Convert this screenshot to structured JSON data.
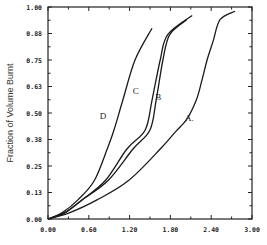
{
  "chart_data": {
    "type": "line",
    "title": "",
    "xlabel": "",
    "ylabel": "Fraction of Volume Burnt",
    "xlim": [
      0.0,
      3.0
    ],
    "ylim": [
      0.0,
      1.0
    ],
    "x_ticks": [
      "0.00",
      "0.60",
      "1.20",
      "1.80",
      "2.40",
      "3.00"
    ],
    "y_ticks": [
      "0.00",
      "0.13",
      "0.25",
      "0.38",
      "0.50",
      "0.63",
      "0.75",
      "0.88",
      "1.00"
    ],
    "grid": false,
    "legend": "inline curve labels",
    "series": [
      {
        "name": "A",
        "label": "A.",
        "x": [
          0.0,
          0.32,
          0.72,
          1.18,
          1.65,
          1.87,
          2.04,
          2.18,
          2.26,
          2.34,
          2.43,
          2.53,
          2.75
        ],
        "y": [
          0.0,
          0.03,
          0.09,
          0.18,
          0.33,
          0.41,
          0.47,
          0.56,
          0.65,
          0.75,
          0.84,
          0.94,
          0.98
        ]
      },
      {
        "name": "B",
        "label": "B",
        "x": [
          0.0,
          0.25,
          0.5,
          0.88,
          1.25,
          1.5,
          1.59,
          1.69,
          1.79,
          2.04
        ],
        "y": [
          0.0,
          0.03,
          0.09,
          0.18,
          0.33,
          0.42,
          0.56,
          0.75,
          0.87,
          0.94
        ]
      },
      {
        "name": "C",
        "label": "C",
        "x": [
          0.0,
          0.25,
          0.5,
          0.84,
          1.16,
          1.43,
          1.53,
          1.65,
          1.76,
          2.12
        ],
        "y": [
          0.0,
          0.03,
          0.09,
          0.18,
          0.33,
          0.42,
          0.56,
          0.75,
          0.87,
          0.96
        ]
      },
      {
        "name": "D",
        "label": "D",
        "x": [
          0.0,
          0.21,
          0.44,
          0.68,
          0.87,
          0.97,
          1.1,
          1.28,
          1.53
        ],
        "y": [
          0.0,
          0.03,
          0.09,
          0.18,
          0.33,
          0.42,
          0.56,
          0.75,
          0.9
        ]
      }
    ],
    "label_positions": {
      "A": [
        2.08,
        0.46
      ],
      "B": [
        1.62,
        0.56
      ],
      "C": [
        1.29,
        0.59
      ],
      "D": [
        0.81,
        0.47
      ]
    }
  }
}
